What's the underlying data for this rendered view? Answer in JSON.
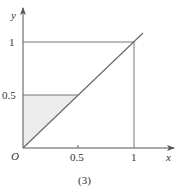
{
  "figure": {
    "caption": "(3)",
    "origin_label": "O",
    "x_axis_label": "x",
    "y_axis_label": "y",
    "x_ticks": [
      "0.5",
      "1"
    ],
    "y_ticks": [
      "0.5",
      "1"
    ]
  },
  "colors": {
    "line": "#555555",
    "shade": "#ececec",
    "text": "#333333"
  }
}
